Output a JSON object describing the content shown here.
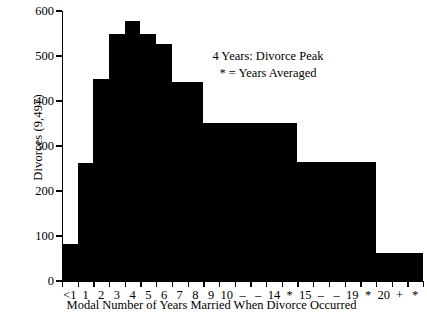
{
  "chart_data": {
    "type": "bar",
    "title": "",
    "subtitle": "",
    "xlabel": "Modal Number of Years Married When Divorce Occurred",
    "ylabel": "Divorces (9,497)",
    "ylim": [
      0,
      600
    ],
    "yticks": [
      0,
      100,
      200,
      300,
      400,
      500,
      600
    ],
    "ytick_labels": [
      "0",
      "100",
      "200",
      "300",
      "400",
      "500",
      "600"
    ],
    "grid": false,
    "legend": null,
    "xtick_labels": [
      "<1",
      "1",
      "2",
      "3",
      "4",
      "5",
      "6",
      "7",
      "8",
      "9",
      "10",
      "–",
      "–",
      "14",
      "*",
      "15",
      "–",
      "–",
      "19",
      "*",
      "20",
      "+",
      "*"
    ],
    "categories": [
      "<1",
      "1",
      "2",
      "3",
      "4",
      "5",
      "6",
      "7",
      "8",
      "9",
      "10-14*",
      "15-19*",
      "20+*"
    ],
    "values": [
      82,
      262,
      450,
      548,
      578,
      548,
      527,
      443,
      443,
      352,
      352,
      265,
      62
    ],
    "bars": [
      {
        "label": "<1",
        "value": 82,
        "start_slot": 0,
        "span_slots": 1
      },
      {
        "label": "1",
        "value": 262,
        "start_slot": 1,
        "span_slots": 1
      },
      {
        "label": "2",
        "value": 450,
        "start_slot": 2,
        "span_slots": 1
      },
      {
        "label": "3",
        "value": 548,
        "start_slot": 3,
        "span_slots": 1
      },
      {
        "label": "4",
        "value": 578,
        "start_slot": 4,
        "span_slots": 1
      },
      {
        "label": "5",
        "value": 548,
        "start_slot": 5,
        "span_slots": 1
      },
      {
        "label": "6",
        "value": 527,
        "start_slot": 6,
        "span_slots": 1
      },
      {
        "label": "7",
        "value": 443,
        "start_slot": 7,
        "span_slots": 1
      },
      {
        "label": "8",
        "value": 443,
        "start_slot": 8,
        "span_slots": 1
      },
      {
        "label": "9",
        "value": 352,
        "start_slot": 9,
        "span_slots": 1
      },
      {
        "label": "10-14*",
        "value": 352,
        "start_slot": 10,
        "span_slots": 5
      },
      {
        "label": "15-19*",
        "value": 265,
        "start_slot": 15,
        "span_slots": 5
      },
      {
        "label": "20+*",
        "value": 62,
        "start_slot": 20,
        "span_slots": 3
      }
    ],
    "annotations": [
      {
        "text": "4 Years: Divorce Peak"
      },
      {
        "text": "* = Years Averaged"
      }
    ],
    "bar_color": "#000000",
    "background_color": "#ffffff",
    "axis_color": "#000000"
  }
}
